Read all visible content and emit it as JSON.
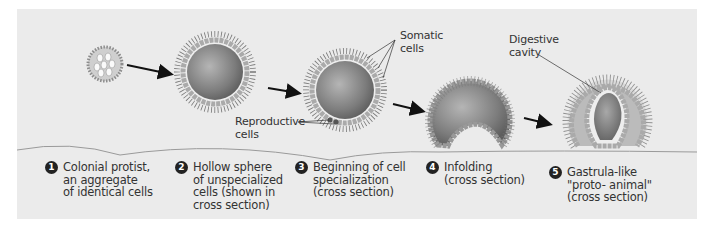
{
  "diagram": {
    "callouts": {
      "somatic": "Somatic\ncells",
      "somatic_l1": "Somatic",
      "somatic_l2": "cells",
      "reproductive_l1": "Reproductive",
      "reproductive_l2": "cells",
      "digestive_l1": "Digestive",
      "digestive_l2": "cavity"
    },
    "steps": [
      {
        "number": "1",
        "text": "Colonial protist,\nan aggregate\nof identical cells"
      },
      {
        "number": "2",
        "text": "Hollow sphere\nof unspecialized\ncells (shown in\ncross section)"
      },
      {
        "number": "3",
        "text": "Beginning of cell\nspecialization\n(cross section)"
      },
      {
        "number": "4",
        "text": "Infolding\n(cross section)"
      },
      {
        "number": "5",
        "text": "Gastrula-like\n\"proto- animal\"\n(cross section)"
      }
    ],
    "colors": {
      "panel_background": "#ebebeb",
      "sphere_fill": "#8a8a8a",
      "cell_fill": "#f2f2f2",
      "arrow": "#111111",
      "divider_line": "#9a9a9a"
    }
  }
}
